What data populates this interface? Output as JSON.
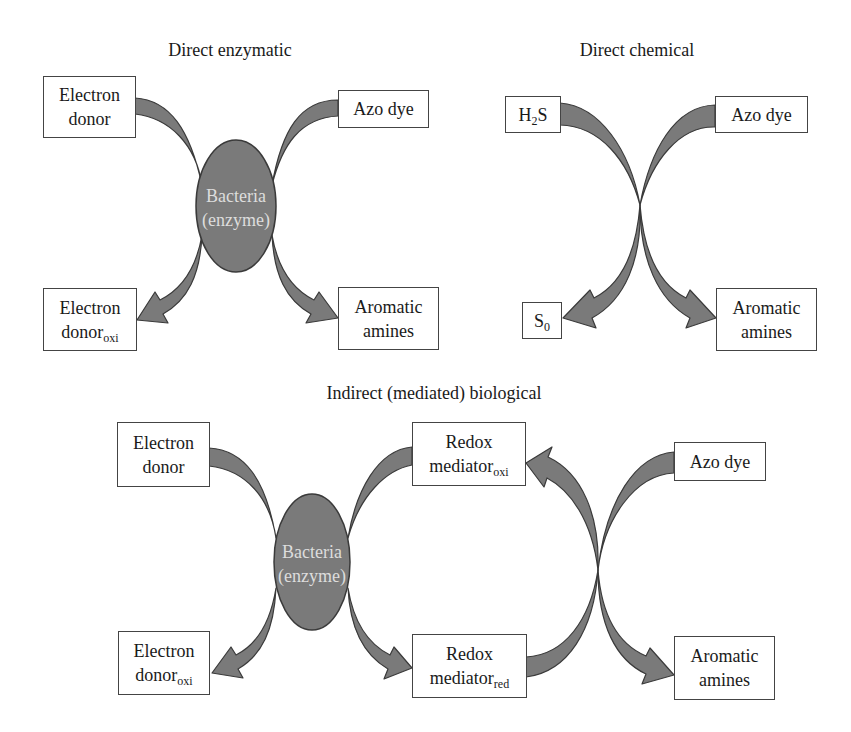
{
  "colors": {
    "arrow_fill": "#7a7a7a",
    "arrow_stroke": "#3a3a3a",
    "ellipse_fill": "#7a7a7a",
    "ellipse_text": "#dddddd",
    "box_border": "#444444"
  },
  "panels": {
    "direct_enzymatic": {
      "title": "Direct enzymatic",
      "electron_donor": {
        "line1": "Electron",
        "line2": "donor"
      },
      "azo_dye": {
        "label": "Azo dye"
      },
      "bacteria": {
        "line1": "Bacteria",
        "line2": "(enzyme)"
      },
      "electron_donor_oxi": {
        "line1": "Electron",
        "line2": "donor",
        "sub": "oxi"
      },
      "aromatic_amines": {
        "line1": "Aromatic",
        "line2": "amines"
      }
    },
    "direct_chemical": {
      "title": "Direct chemical",
      "h2s": {
        "pre": "H",
        "sub": "2",
        "post": "S"
      },
      "azo_dye": {
        "label": "Azo dye"
      },
      "s0": {
        "pre": "S",
        "sub": "0"
      },
      "aromatic_amines": {
        "line1": "Aromatic",
        "line2": "amines"
      }
    },
    "indirect_biological": {
      "title": "Indirect (mediated) biological",
      "electron_donor": {
        "line1": "Electron",
        "line2": "donor"
      },
      "bacteria": {
        "line1": "Bacteria",
        "line2": "(enzyme)"
      },
      "electron_donor_oxi": {
        "line1": "Electron",
        "line2": "donor",
        "sub": "oxi"
      },
      "redox_mediator_oxi": {
        "line1": "Redox",
        "line2": "mediator",
        "sub": "oxi"
      },
      "redox_mediator_red": {
        "line1": "Redox",
        "line2": "mediator",
        "sub": "red"
      },
      "azo_dye": {
        "label": "Azo dye"
      },
      "aromatic_amines": {
        "line1": "Aromatic",
        "line2": "amines"
      }
    }
  }
}
